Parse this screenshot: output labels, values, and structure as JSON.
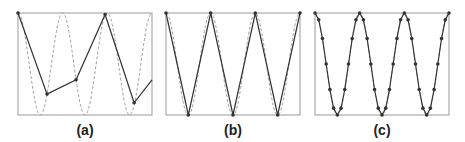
{
  "figure": {
    "panels": [
      {
        "id": "a",
        "label": "(a)",
        "sampling": "undersampled"
      },
      {
        "id": "b",
        "label": "(b)",
        "sampling": "2 samples per period (Nyquist)"
      },
      {
        "id": "c",
        "label": "(c)",
        "sampling": "oversampled"
      }
    ]
  },
  "colors": {
    "frame": "#999999",
    "signal_dashed": "#a0a0a0",
    "sampled_line": "#333333",
    "marker": "#333333"
  },
  "chart_data": [
    {
      "type": "line",
      "title": "(a)",
      "xlabel": "",
      "ylabel": "",
      "xlim": [
        0,
        3
      ],
      "ylim": [
        -1,
        1
      ],
      "grid": false,
      "series": [
        {
          "name": "continuous signal",
          "style": "dashed",
          "x": "0..3 (3 periods)",
          "function": "cos(2*pi*t)"
        },
        {
          "name": "samples",
          "style": "solid-with-markers",
          "x": [
            0,
            0.65,
            1.3,
            1.95,
            2.6,
            3.0
          ],
          "y": [
            1.0,
            -0.59,
            -0.31,
            0.97,
            -0.76,
            -0.31
          ]
        }
      ]
    },
    {
      "type": "line",
      "title": "(b)",
      "xlabel": "",
      "ylabel": "",
      "xlim": [
        0,
        3
      ],
      "ylim": [
        -1,
        1
      ],
      "grid": false,
      "series": [
        {
          "name": "continuous signal",
          "style": "dashed",
          "function": "cos(2*pi*t)"
        },
        {
          "name": "samples",
          "style": "solid-with-markers",
          "x": [
            0,
            0.5,
            1.0,
            1.5,
            2.0,
            2.5,
            3.0
          ],
          "y": [
            1,
            -1,
            1,
            -1,
            1,
            -1,
            1
          ]
        }
      ]
    },
    {
      "type": "line",
      "title": "(c)",
      "xlabel": "",
      "ylabel": "",
      "xlim": [
        0,
        3
      ],
      "ylim": [
        -1,
        1
      ],
      "grid": false,
      "series": [
        {
          "name": "continuous signal",
          "style": "dashed",
          "function": "cos(2*pi*t)"
        },
        {
          "name": "samples",
          "style": "solid-with-markers",
          "samples_per_period": 12,
          "x": [
            0,
            0.0833,
            0.1667,
            0.25,
            0.3333,
            0.4167,
            0.5,
            0.5833,
            0.6667,
            0.75,
            0.8333,
            0.9167,
            1.0,
            1.0833,
            1.1667,
            1.25,
            1.3333,
            1.4167,
            1.5,
            1.5833,
            1.6667,
            1.75,
            1.8333,
            1.9167,
            2.0,
            2.0833,
            2.1667,
            2.25,
            2.3333,
            2.4167,
            2.5,
            2.5833,
            2.6667,
            2.75,
            2.8333,
            2.9167,
            3.0
          ],
          "y": [
            1,
            0.866,
            0.5,
            0,
            -0.5,
            -0.866,
            -1,
            -0.866,
            -0.5,
            0,
            0.5,
            0.866,
            1,
            0.866,
            0.5,
            0,
            -0.5,
            -0.866,
            -1,
            -0.866,
            -0.5,
            0,
            0.5,
            0.866,
            1,
            0.866,
            0.5,
            0,
            -0.5,
            -0.866,
            -1,
            -0.866,
            -0.5,
            0,
            0.5,
            0.866,
            1
          ]
        }
      ]
    }
  ]
}
